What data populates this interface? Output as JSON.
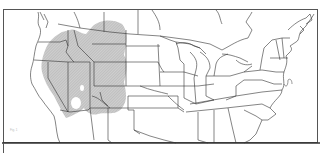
{
  "map": {
    "type": "range-map",
    "region": "Contiguous United States and southern Canada",
    "shaded_region": "Western United States (Great Basin, Rocky Mountains, Columbia Plateau)",
    "shade_color": "#c4c4c4",
    "line_color": "#333333",
    "background": "#ffffff",
    "caption": "Fig. 1"
  }
}
